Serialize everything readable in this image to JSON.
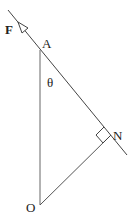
{
  "diagram": {
    "type": "geometry-force-diagram",
    "labels": {
      "force": "F",
      "pointA": "A",
      "angle": "θ",
      "pointN": "N",
      "pointO": "O"
    },
    "colors": {
      "line": "#444444",
      "text": "#222222",
      "background": "#ffffff"
    },
    "elements": [
      {
        "kind": "line",
        "name": "inclined-line",
        "from": [
          8,
          10
        ],
        "to": [
          127,
          155
        ]
      },
      {
        "kind": "line",
        "name": "vertical-AO",
        "from": [
          40,
          50
        ],
        "to": [
          40,
          205
        ]
      },
      {
        "kind": "line",
        "name": "perpendicular-ON",
        "from": [
          40,
          205
        ],
        "to": [
          111,
          135
        ]
      },
      {
        "kind": "arrow",
        "name": "force-arrow-F",
        "position": [
          20,
          25
        ],
        "direction": "up-left"
      },
      {
        "kind": "right-angle-marker",
        "at": "N"
      }
    ]
  }
}
